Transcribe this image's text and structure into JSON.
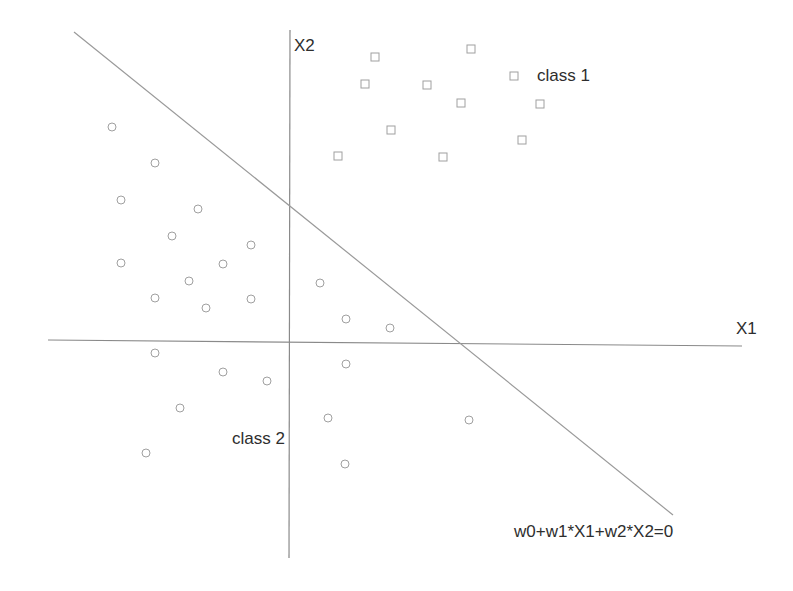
{
  "labels": {
    "x1_axis": "X1",
    "x2_axis": "X2",
    "class1": "class 1",
    "class2": "class 2",
    "boundary_equation": "w0+w1*X1+w2*X2=0"
  },
  "colors": {
    "axis": "#8a8a8a",
    "boundary": "#9a9a9a",
    "marker": "#a0a0a0",
    "text": "#2e2e2e"
  },
  "geometry": {
    "x2_axis": {
      "x1": 290,
      "y1": 30,
      "x2": 289,
      "y2": 558
    },
    "x1_axis": {
      "x1": 48,
      "y1": 340,
      "x2": 742,
      "y2": 346
    },
    "boundary": {
      "x1": 74,
      "y1": 32,
      "x2": 673,
      "y2": 515
    }
  },
  "class1_points": [
    [
      375,
      57
    ],
    [
      471,
      49
    ],
    [
      365,
      84
    ],
    [
      427,
      85
    ],
    [
      514,
      76
    ],
    [
      461,
      103
    ],
    [
      540,
      104
    ],
    [
      391,
      130
    ],
    [
      522,
      140
    ],
    [
      338,
      156
    ],
    [
      443,
      157
    ]
  ],
  "class2_points": [
    [
      112,
      127
    ],
    [
      155,
      163
    ],
    [
      121,
      200
    ],
    [
      198,
      209
    ],
    [
      172,
      236
    ],
    [
      251,
      245
    ],
    [
      121,
      263
    ],
    [
      223,
      264
    ],
    [
      189,
      281
    ],
    [
      155,
      298
    ],
    [
      206,
      308
    ],
    [
      251,
      299
    ],
    [
      320,
      283
    ],
    [
      346,
      319
    ],
    [
      390,
      328
    ],
    [
      155,
      353
    ],
    [
      346,
      364
    ],
    [
      223,
      372
    ],
    [
      267,
      381
    ],
    [
      180,
      408
    ],
    [
      328,
      418
    ],
    [
      469,
      420
    ],
    [
      146,
      453
    ],
    [
      345,
      464
    ]
  ]
}
